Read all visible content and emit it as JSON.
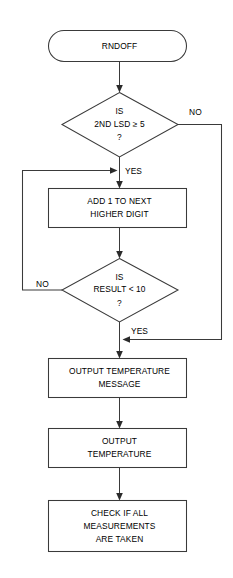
{
  "diagram": {
    "title": "RNDOFF",
    "type": "flowchart",
    "orientation": "top-to-bottom",
    "canvas": {
      "width": 233,
      "height": 578
    },
    "colors": {
      "background": "#ffffff",
      "stroke": "#3a3a3a",
      "text": "#000000",
      "arrow": "#2b2b2b"
    },
    "nodes": [
      {
        "id": "start",
        "shape": "terminator",
        "lines": [
          "RNDOFF"
        ],
        "label": "RNDOFF"
      },
      {
        "id": "decision-lsd",
        "shape": "decision",
        "lines": [
          "IS",
          "2ND LSD ≥ 5",
          "?"
        ],
        "label": "IS 2ND LSD ≥ 5 ?"
      },
      {
        "id": "process-add",
        "shape": "process",
        "lines": [
          "ADD 1 TO NEXT",
          "HIGHER DIGIT"
        ],
        "label": "ADD 1 TO NEXT HIGHER DIGIT"
      },
      {
        "id": "decision-result",
        "shape": "decision",
        "lines": [
          "IS",
          "RESULT < 10",
          "?"
        ],
        "label": "IS RESULT < 10 ?"
      },
      {
        "id": "process-msg",
        "shape": "process",
        "lines": [
          "OUTPUT TEMPERATURE",
          "MESSAGE"
        ],
        "label": "OUTPUT TEMPERATURE MESSAGE"
      },
      {
        "id": "process-temp",
        "shape": "process",
        "lines": [
          "OUTPUT",
          "TEMPERATURE"
        ],
        "label": "OUTPUT TEMPERATURE"
      },
      {
        "id": "process-check",
        "shape": "process",
        "lines": [
          "CHECK IF ALL",
          "MEASUREMENTS",
          "ARE TAKEN"
        ],
        "label": "CHECK IF ALL MEASUREMENTS ARE TAKEN"
      }
    ],
    "edge_labels": {
      "lsd_no": "NO",
      "lsd_yes": "YES",
      "result_no": "NO",
      "result_yes": "YES"
    },
    "edges": [
      {
        "from": "start",
        "to": "decision-lsd",
        "label": ""
      },
      {
        "from": "decision-lsd",
        "to": "process-add",
        "label": "YES"
      },
      {
        "from": "decision-lsd",
        "to": "process-msg",
        "label": "NO"
      },
      {
        "from": "process-add",
        "to": "decision-result",
        "label": ""
      },
      {
        "from": "decision-result",
        "to": "process-add",
        "label": "NO"
      },
      {
        "from": "decision-result",
        "to": "process-msg",
        "label": "YES"
      },
      {
        "from": "process-msg",
        "to": "process-temp",
        "label": ""
      },
      {
        "from": "process-temp",
        "to": "process-check",
        "label": ""
      }
    ]
  }
}
